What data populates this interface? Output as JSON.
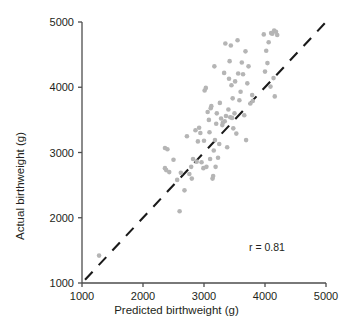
{
  "chart_data": {
    "type": "scatter",
    "title": "",
    "xlabel": "Predicted birthweight (g)",
    "ylabel": "Actual birthweight (g)",
    "xlim": [
      1000,
      5000
    ],
    "ylim": [
      1000,
      5000
    ],
    "xticks": [
      1000,
      2000,
      3000,
      4000,
      5000
    ],
    "yticks": [
      1000,
      2000,
      3000,
      4000,
      5000
    ],
    "xtick_labels": [
      "1000",
      "2000",
      "3000",
      "4000",
      "5000"
    ],
    "ytick_labels": [
      "1000",
      "2000",
      "3000",
      "4000",
      "5000"
    ],
    "grid": false,
    "legend": null,
    "annotations": [
      {
        "text": "r = 0.81",
        "x": 4300,
        "y": 1620
      }
    ],
    "reference_line": {
      "type": "identity",
      "style": "dashed",
      "color": "#1a1a1a",
      "from": [
        1050,
        1050
      ],
      "to": [
        5000,
        5000
      ]
    },
    "marker": {
      "shape": "circle",
      "color": "#b5b5b5",
      "size_px": 4.6
    },
    "series": [
      {
        "name": "births",
        "points": [
          [
            1280,
            1420
          ],
          [
            2360,
            2760
          ],
          [
            2360,
            3070
          ],
          [
            2380,
            2730
          ],
          [
            2400,
            3050
          ],
          [
            2430,
            2700
          ],
          [
            2500,
            2890
          ],
          [
            2560,
            2580
          ],
          [
            2600,
            2100
          ],
          [
            2620,
            2690
          ],
          [
            2680,
            2420
          ],
          [
            2720,
            3250
          ],
          [
            2760,
            2670
          ],
          [
            2790,
            2780
          ],
          [
            2800,
            2600
          ],
          [
            2820,
            2900
          ],
          [
            2860,
            3340
          ],
          [
            2880,
            2860
          ],
          [
            2900,
            3170
          ],
          [
            2920,
            3380
          ],
          [
            2940,
            3300
          ],
          [
            2960,
            2850
          ],
          [
            2990,
            2760
          ],
          [
            3000,
            3180
          ],
          [
            3010,
            3950
          ],
          [
            3030,
            3990
          ],
          [
            3040,
            2780
          ],
          [
            3060,
            3620
          ],
          [
            3080,
            3500
          ],
          [
            3090,
            3310
          ],
          [
            3100,
            2900
          ],
          [
            3110,
            3680
          ],
          [
            3120,
            3710
          ],
          [
            3140,
            2600
          ],
          [
            3150,
            2640
          ],
          [
            3160,
            3030
          ],
          [
            3170,
            4320
          ],
          [
            3180,
            3190
          ],
          [
            3190,
            2780
          ],
          [
            3200,
            3440
          ],
          [
            3210,
            3600
          ],
          [
            3230,
            2920
          ],
          [
            3250,
            3130
          ],
          [
            3260,
            3760
          ],
          [
            3280,
            3520
          ],
          [
            3300,
            3420
          ],
          [
            3310,
            3460
          ],
          [
            3330,
            4220
          ],
          [
            3340,
            3480
          ],
          [
            3350,
            4670
          ],
          [
            3360,
            3560
          ],
          [
            3380,
            3080
          ],
          [
            3400,
            3660
          ],
          [
            3410,
            4130
          ],
          [
            3420,
            4400
          ],
          [
            3430,
            3540
          ],
          [
            3440,
            4640
          ],
          [
            3450,
            4030
          ],
          [
            3460,
            3530
          ],
          [
            3470,
            3830
          ],
          [
            3480,
            3370
          ],
          [
            3500,
            3600
          ],
          [
            3510,
            4090
          ],
          [
            3530,
            3290
          ],
          [
            3550,
            4720
          ],
          [
            3560,
            4210
          ],
          [
            3580,
            3800
          ],
          [
            3600,
            3930
          ],
          [
            3620,
            4380
          ],
          [
            3640,
            4200
          ],
          [
            3660,
            3570
          ],
          [
            3680,
            4550
          ],
          [
            3690,
            3190
          ],
          [
            3710,
            4060
          ],
          [
            3730,
            4320
          ],
          [
            3760,
            3750
          ],
          [
            3790,
            3880
          ],
          [
            3800,
            3790
          ],
          [
            3980,
            4810
          ],
          [
            4000,
            4240
          ],
          [
            4020,
            4560
          ],
          [
            4040,
            4370
          ],
          [
            4060,
            4690
          ],
          [
            4090,
            4010
          ],
          [
            4100,
            4830
          ],
          [
            4120,
            4820
          ],
          [
            4140,
            4140
          ],
          [
            4150,
            4870
          ],
          [
            4160,
            3860
          ],
          [
            4180,
            4850
          ],
          [
            4200,
            4800
          ]
        ]
      }
    ]
  },
  "axes_geometry": {
    "left_px": 82,
    "right_px": 326,
    "top_px": 22,
    "bottom_px": 283
  }
}
